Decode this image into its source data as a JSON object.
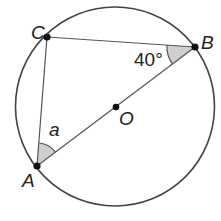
{
  "diagram": {
    "points": {
      "A": {
        "label": "A",
        "x": 37,
        "y": 166
      },
      "B": {
        "label": "B",
        "x": 195,
        "y": 47
      },
      "C": {
        "label": "C",
        "x": 47,
        "y": 37
      },
      "O": {
        "label": "O",
        "x": 116,
        "y": 107
      }
    },
    "circle": {
      "cx": 115,
      "cy": 106.5,
      "r": 100
    },
    "angles": {
      "B": {
        "label": "40°"
      },
      "A": {
        "label": "a"
      }
    },
    "colors": {
      "stroke": "#444444",
      "fill_angle": "#c8c8c8",
      "point": "#111111"
    }
  }
}
